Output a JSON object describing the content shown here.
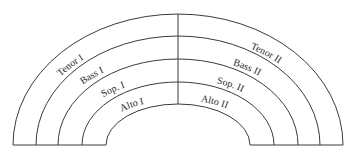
{
  "diagram": {
    "title": "",
    "type": "choir seating arrangement (semicircle)",
    "left_labels": [
      "Tenor I",
      "Bass I",
      "Sop. I",
      "Alto I"
    ],
    "right_labels": [
      "Tenor II",
      "Bass II",
      "Sop. II",
      "Alto II"
    ],
    "stroke_color": "#3a3a3a"
  }
}
